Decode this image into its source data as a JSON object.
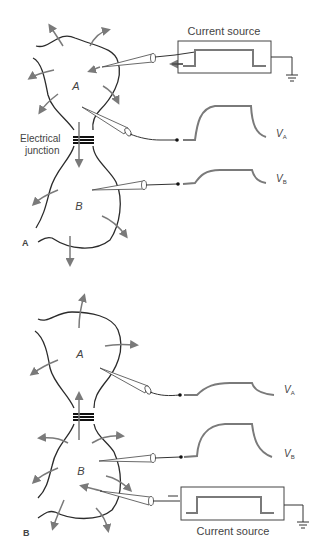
{
  "panel_a": {
    "label": "A",
    "cell_top_label": "A",
    "cell_bottom_label": "B",
    "junction_label_line1": "Electrical",
    "junction_label_line2": "junction",
    "source_label": "Current source",
    "trace_top_label": "V",
    "trace_top_sub": "A",
    "trace_bottom_label": "V",
    "trace_bottom_sub": "B"
  },
  "panel_b": {
    "label": "B",
    "cell_top_label": "A",
    "cell_bottom_label": "B",
    "source_label": "Current source",
    "trace_top_label": "V",
    "trace_top_sub": "A",
    "trace_bottom_label": "V",
    "trace_bottom_sub": "B"
  },
  "colors": {
    "membrane": "#2b2b2b",
    "arrows": "#7a7a7a",
    "traces": "#7a7a7a"
  }
}
